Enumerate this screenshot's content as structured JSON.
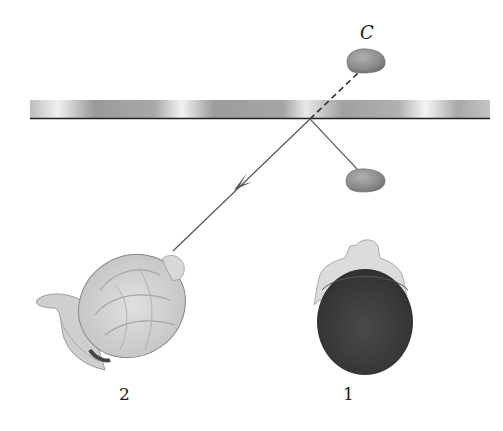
{
  "diagram": {
    "type": "mirror-reflection-ray-diagram",
    "colors": {
      "background": "#ffffff",
      "mirror_light": "#e6e6e6",
      "mirror_dark": "#8a8a8a",
      "mirror_edge": "#222222",
      "ray": "#555555",
      "stone": "#8c8c8c",
      "hair_dark": "#3a3a3a",
      "hair_light": "#d2d2d2",
      "skin": "#dedede"
    },
    "labels": {
      "object": "C",
      "observer_1": "1",
      "observer_2": "2"
    },
    "elements": {
      "mirror": "horizontal plane mirror",
      "object_stone": "stone C (virtual image above mirror)",
      "real_stone": "stone below mirror",
      "incident_ray": "ray from stone to mirror",
      "reflected_ray": "reflected ray with arrow toward observer 2",
      "virtual_ray": "dashed extension to image C",
      "head_1": "dark-haired head (top view)",
      "head_2": "light-haired head with ponytail (top view)"
    }
  }
}
